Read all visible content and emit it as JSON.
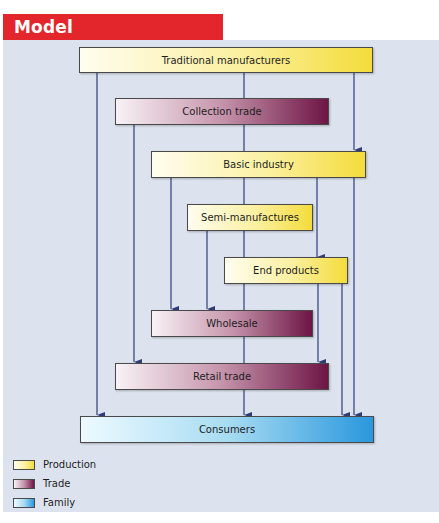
{
  "title": "Model",
  "colors": {
    "title_bar": "#e3262b",
    "panel_bg": "#dde3ee",
    "arrow": "#2e3d78",
    "production": "#f4dc3c",
    "trade": "#6e1545",
    "family": "#2a97dd"
  },
  "nodes": {
    "traditional_manufacturers": "Traditional manufacturers",
    "collection_trade": "Collection trade",
    "basic_industry": "Basic industry",
    "semi_manufactures": "Semi-manufactures",
    "end_products": "End products",
    "wholesale": "Wholesale",
    "retail_trade": "Retail trade",
    "consumers": "Consumers"
  },
  "edges": [
    {
      "from": "Traditional manufacturers",
      "to": "Collection trade"
    },
    {
      "from": "Traditional manufacturers",
      "to": "Basic industry"
    },
    {
      "from": "Traditional manufacturers",
      "to": "Consumers"
    },
    {
      "from": "Collection trade",
      "to": "Basic industry"
    },
    {
      "from": "Collection trade",
      "to": "Retail trade"
    },
    {
      "from": "Basic industry",
      "to": "Semi-manufactures"
    },
    {
      "from": "Basic industry",
      "to": "Wholesale"
    },
    {
      "from": "Basic industry",
      "to": "End products"
    },
    {
      "from": "Basic industry",
      "to": "Consumers"
    },
    {
      "from": "Semi-manufactures",
      "to": "Wholesale"
    },
    {
      "from": "Semi-manufactures",
      "to": "End products"
    },
    {
      "from": "End products",
      "to": "Wholesale"
    },
    {
      "from": "End products",
      "to": "Retail trade"
    },
    {
      "from": "End products",
      "to": "Consumers"
    },
    {
      "from": "Wholesale",
      "to": "Retail trade"
    },
    {
      "from": "Retail trade",
      "to": "Consumers"
    }
  ],
  "legend": [
    {
      "label": "Production",
      "category": "production"
    },
    {
      "label": "Trade",
      "category": "trade"
    },
    {
      "label": "Family",
      "category": "family"
    }
  ]
}
